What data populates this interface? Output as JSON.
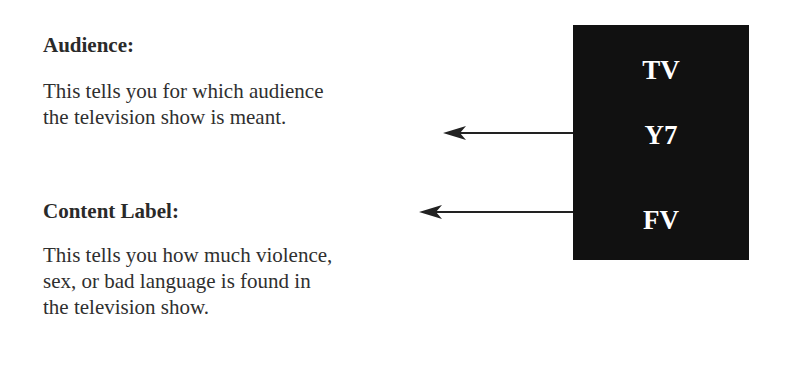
{
  "audience": {
    "heading": "Audience:",
    "lines": [
      "This tells you for which audience",
      "the television show is meant."
    ]
  },
  "content_label": {
    "heading": "Content Label:",
    "lines": [
      "This tells you how much violence,",
      "sex, or bad language is found in",
      "the television show."
    ]
  },
  "rating_box": {
    "items": [
      "TV",
      "Y7",
      "FV"
    ],
    "background": "#111111",
    "text_color": "#ffffff"
  },
  "arrows": [
    {
      "from": "Y7",
      "to": "Audience description"
    },
    {
      "from": "FV",
      "to": "Content Label heading"
    }
  ]
}
